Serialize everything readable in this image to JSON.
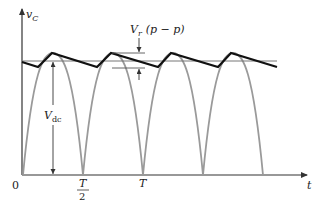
{
  "diagram": {
    "y_axis_label": "v",
    "y_axis_subscript": "C",
    "x_axis_label": "t",
    "origin_label": "0",
    "ticks": [
      {
        "num": "T",
        "den": "2"
      },
      {
        "num": "T",
        "den": ""
      }
    ],
    "ripple_label": "V",
    "ripple_sub": "r",
    "ripple_suffix": "(p − p)",
    "vdc_label": "V",
    "vdc_sub": "dc",
    "colors": {
      "axes": "#333333",
      "rectified_sine": "#9a9a9a",
      "ripple_waveform": "#111111",
      "reference_lines": "#777777"
    }
  }
}
